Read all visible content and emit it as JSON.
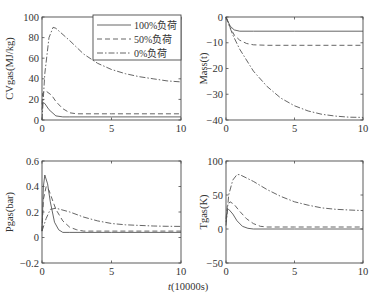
{
  "figure": {
    "shared_xlabel": "t(10000s)",
    "legend": [
      {
        "label": "100%负荷",
        "style": "solid"
      },
      {
        "label": "50%负荷",
        "style": "dashed"
      },
      {
        "label": "0%负荷",
        "style": "dashdot"
      }
    ]
  },
  "chart_data": [
    {
      "type": "line",
      "position": "top-left",
      "title": "",
      "xlabel": "",
      "ylabel": "CVgas(MJ/kg)",
      "xlim": [
        0,
        10
      ],
      "ylim": [
        0,
        100
      ],
      "xticks": [
        "0",
        "5",
        "10"
      ],
      "yticks": [
        "0",
        "20",
        "40",
        "60",
        "80",
        "100"
      ],
      "legend_position": "upper right",
      "grid": false,
      "series": [
        {
          "name": "100%负荷",
          "style": "solid",
          "x": [
            0,
            0.05,
            0.2,
            0.5,
            1,
            1.5,
            2,
            5,
            10
          ],
          "y": [
            10,
            17,
            16,
            10,
            4,
            3,
            3,
            3,
            3
          ]
        },
        {
          "name": "50%负荷",
          "style": "dashed",
          "x": [
            0,
            0.05,
            0.3,
            0.7,
            1,
            1.5,
            2,
            2.5,
            5,
            10
          ],
          "y": [
            15,
            26,
            28,
            24,
            18,
            11,
            7,
            6,
            6,
            6
          ]
        },
        {
          "name": "0%负荷",
          "style": "dashdot",
          "x": [
            0,
            0.2,
            0.5,
            0.8,
            1,
            2,
            3,
            4,
            5,
            6,
            7,
            8,
            9,
            10
          ],
          "y": [
            0,
            45,
            80,
            90,
            89,
            77,
            64,
            55,
            49,
            45,
            42,
            40,
            38,
            37
          ]
        }
      ]
    },
    {
      "type": "line",
      "position": "top-right",
      "title": "",
      "xlabel": "",
      "ylabel": "Mass(t)",
      "xlim": [
        0,
        10
      ],
      "ylim": [
        -40,
        0
      ],
      "xticks": [
        "0",
        "5",
        "10"
      ],
      "yticks": [
        "-40",
        "-30",
        "-20",
        "-10",
        "0"
      ],
      "grid": false,
      "series": [
        {
          "name": "100%负荷",
          "style": "solid",
          "x": [
            0,
            0.3,
            0.6,
            1,
            2,
            5,
            10
          ],
          "y": [
            0,
            -3.5,
            -5,
            -5.5,
            -5.5,
            -5.5,
            -5.5
          ]
        },
        {
          "name": "50%负荷",
          "style": "dashed",
          "x": [
            0,
            0.3,
            0.6,
            1,
            1.5,
            2,
            3,
            5,
            10
          ],
          "y": [
            0,
            -4,
            -7,
            -9,
            -10.3,
            -10.8,
            -11,
            -11,
            -11
          ]
        },
        {
          "name": "0%负荷",
          "style": "dashdot",
          "x": [
            0,
            0.5,
            1,
            2,
            3,
            4,
            5,
            6,
            7,
            8,
            9,
            10
          ],
          "y": [
            0,
            -7,
            -12.5,
            -21,
            -27,
            -31.5,
            -34.5,
            -36.5,
            -37.8,
            -38.5,
            -38.9,
            -39
          ]
        }
      ]
    },
    {
      "type": "line",
      "position": "bottom-left",
      "title": "",
      "xlabel": "",
      "ylabel": "Pgas(bar)",
      "xlim": [
        0,
        10
      ],
      "ylim": [
        -0.2,
        0.6
      ],
      "xticks": [
        "0",
        "5",
        "10"
      ],
      "yticks": [
        "-0.2",
        "0",
        "0.2",
        "0.4",
        "0.6"
      ],
      "grid": false,
      "series": [
        {
          "name": "100%负荷",
          "style": "solid",
          "x": [
            0,
            0.1,
            0.2,
            0.4,
            0.6,
            0.9,
            1.2,
            1.5,
            2,
            5,
            10
          ],
          "y": [
            0.05,
            0.4,
            0.49,
            0.42,
            0.28,
            0.12,
            0.06,
            0.04,
            0.04,
            0.04,
            0.04
          ]
        },
        {
          "name": "50%负荷",
          "style": "dashed",
          "x": [
            0,
            0.1,
            0.3,
            0.5,
            0.8,
            1,
            1.5,
            2,
            2.5,
            3,
            5,
            10
          ],
          "y": [
            0.05,
            0.3,
            0.4,
            0.37,
            0.28,
            0.22,
            0.13,
            0.08,
            0.06,
            0.05,
            0.05,
            0.05
          ]
        },
        {
          "name": "0%负荷",
          "style": "dashdot",
          "x": [
            0,
            0.3,
            0.6,
            1,
            2,
            3,
            4,
            5,
            6,
            7,
            8,
            9,
            10
          ],
          "y": [
            0.05,
            0.15,
            0.22,
            0.23,
            0.2,
            0.16,
            0.13,
            0.11,
            0.1,
            0.095,
            0.09,
            0.088,
            0.087
          ]
        }
      ]
    },
    {
      "type": "line",
      "position": "bottom-right",
      "title": "",
      "xlabel": "",
      "ylabel": "Tgas(K)",
      "xlim": [
        0,
        10
      ],
      "ylim": [
        -50,
        100
      ],
      "xticks": [
        "0",
        "5",
        "10"
      ],
      "yticks": [
        "-50",
        "0",
        "50",
        "100"
      ],
      "grid": false,
      "series": [
        {
          "name": "100%负荷",
          "style": "solid",
          "x": [
            0,
            0.1,
            0.2,
            0.5,
            0.8,
            1.2,
            1.6,
            2,
            5,
            10
          ],
          "y": [
            10,
            28,
            29,
            22,
            12,
            4,
            1,
            0,
            0,
            0
          ]
        },
        {
          "name": "50%负荷",
          "style": "dashed",
          "x": [
            0,
            0.1,
            0.3,
            0.6,
            1,
            1.5,
            2,
            2.5,
            3,
            5,
            10
          ],
          "y": [
            15,
            35,
            40,
            36,
            26,
            15,
            8,
            4,
            3,
            3,
            3
          ]
        },
        {
          "name": "0%负荷",
          "style": "dashdot",
          "x": [
            0,
            0.2,
            0.5,
            0.8,
            1,
            2,
            3,
            4,
            5,
            6,
            7,
            8,
            9,
            10
          ],
          "y": [
            5,
            50,
            72,
            80,
            80,
            70,
            58,
            48,
            40,
            35,
            31,
            29,
            28,
            27
          ]
        }
      ]
    }
  ],
  "plot_boxes": [
    {
      "x0": 42,
      "x1": 181,
      "y0": 17,
      "y1": 120
    },
    {
      "x0": 226,
      "x1": 363,
      "y0": 17,
      "y1": 120
    },
    {
      "x0": 42,
      "x1": 181,
      "y0": 161,
      "y1": 263
    },
    {
      "x0": 226,
      "x1": 363,
      "y0": 161,
      "y1": 263
    }
  ],
  "colors": {
    "axis": "#4a4a4a",
    "line": "#555555",
    "text": "#333333"
  }
}
